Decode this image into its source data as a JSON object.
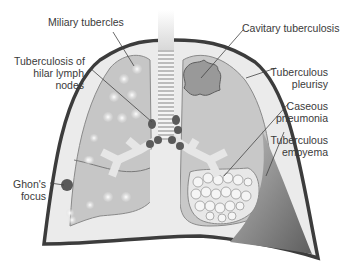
{
  "diagram": {
    "type": "anatomical-illustration",
    "labels": {
      "miliary_tubercles": "Miliary tubercles",
      "hilar_lymph_nodes_line1": "Tuberculosis of",
      "hilar_lymph_nodes_line2": "hilar lymph",
      "hilar_lymph_nodes_line3": "nodes",
      "ghons_focus_line1": "Ghon's",
      "ghons_focus_line2": "focus",
      "cavitary_tuberculosis": "Cavitary tuberculosis",
      "tuberculous_pleurisy_line1": "Tuberculous",
      "tuberculous_pleurisy_line2": "pleurisy",
      "caseous_pneumonia_line1": "Caseous",
      "caseous_pneumonia_line2": "pneumonia",
      "tuberculous_empyema_line1": "Tuberculous",
      "tuberculous_empyema_line2": "empyema"
    },
    "colors": {
      "pleura_outline": "#3c3c3c",
      "pleural_space": "#ebebeb",
      "lung_tissue": "#c4c4c4",
      "lesion_dark": "#555555",
      "empyema": "#7a7a7a",
      "text": "#3a3a3a"
    }
  }
}
